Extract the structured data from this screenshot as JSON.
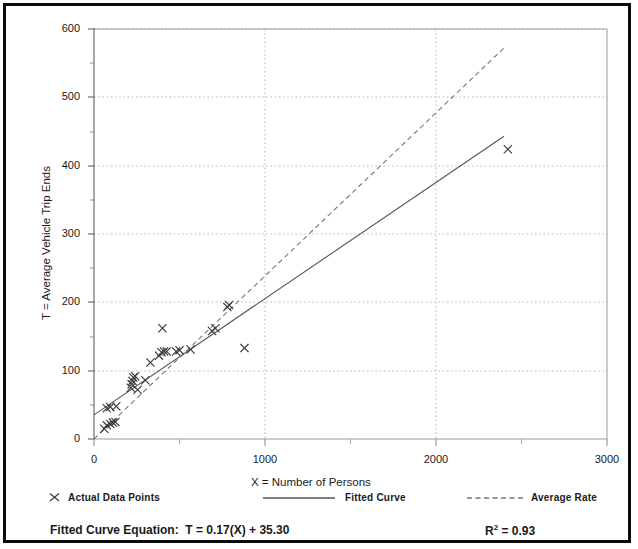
{
  "chart_data": {
    "type": "scatter",
    "title": "",
    "xlabel": "X = Number of Persons",
    "ylabel": "T = Average Vehicle Trip Ends",
    "xlim": [
      0,
      3000
    ],
    "ylim": [
      0,
      600
    ],
    "xticks": [
      0,
      1000,
      2000,
      3000
    ],
    "yticks": [
      0,
      100,
      200,
      300,
      400,
      500,
      600
    ],
    "xtick_labels": [
      "0",
      "1000",
      "2000",
      "3000"
    ],
    "ytick_labels": [
      "0",
      "100",
      "200",
      "300",
      "400",
      "500",
      "600"
    ],
    "grid": true,
    "grid_style": "dotted",
    "legend_position": "below-axis",
    "series": [
      {
        "name": "Actual Data Points",
        "type": "scatter",
        "marker": "x",
        "points": [
          [
            60,
            15
          ],
          [
            75,
            20
          ],
          [
            95,
            22
          ],
          [
            110,
            24
          ],
          [
            125,
            25
          ],
          [
            75,
            45
          ],
          [
            95,
            47
          ],
          [
            130,
            48
          ],
          [
            215,
            75
          ],
          [
            220,
            80
          ],
          [
            225,
            85
          ],
          [
            230,
            90
          ],
          [
            240,
            92
          ],
          [
            255,
            72
          ],
          [
            300,
            86
          ],
          [
            330,
            112
          ],
          [
            380,
            122
          ],
          [
            395,
            127
          ],
          [
            410,
            128
          ],
          [
            425,
            128
          ],
          [
            400,
            162
          ],
          [
            480,
            128
          ],
          [
            500,
            130
          ],
          [
            565,
            131
          ],
          [
            690,
            158
          ],
          [
            710,
            162
          ],
          [
            780,
            193
          ],
          [
            790,
            196
          ],
          [
            880,
            133
          ],
          [
            2420,
            424
          ]
        ]
      },
      {
        "name": "Fitted Curve",
        "type": "line",
        "style": "solid",
        "equation": "T = 0.17(X) + 35.30",
        "slope": 0.17,
        "intercept": 35.3,
        "r_squared": 0.93,
        "x_range": [
          0,
          2400
        ]
      },
      {
        "name": "Average Rate",
        "type": "line",
        "style": "dashed",
        "slope": 0.2383,
        "intercept": 0,
        "x_range": [
          0,
          2400
        ]
      }
    ]
  },
  "legend": {
    "items": [
      {
        "marker": "x-marker",
        "label": "Actual Data Points"
      },
      {
        "marker": "solid-line",
        "label": "Fitted Curve"
      },
      {
        "marker": "dashed-line",
        "label": "Average Rate"
      }
    ]
  },
  "footer": {
    "equation_label": "Fitted Curve Equation:",
    "equation_value": "T = 0.17(X) + 35.30",
    "r_label": "R",
    "r_exponent": "2",
    "r_value": "= 0.93"
  },
  "colors": {
    "frame": "#0b0b0b",
    "axis": "#808080",
    "grid": "#b9b9b9",
    "fitted_line": "#555555",
    "average_line": "#777777",
    "marker": "#3a3a3a",
    "text": "#1a1a1a"
  }
}
